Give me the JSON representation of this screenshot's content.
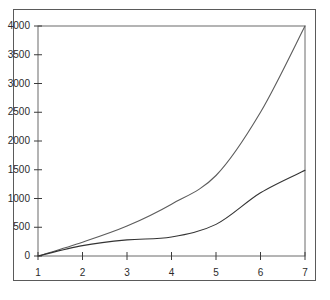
{
  "chart_data": {
    "type": "line",
    "title": "",
    "subtitle": "",
    "xlabel": "",
    "ylabel": "",
    "x": [
      1,
      2,
      3,
      4,
      5,
      6,
      7
    ],
    "xticks": [
      "1",
      "2",
      "3",
      "4",
      "5",
      "6",
      "7"
    ],
    "yticks": [
      "0",
      "500",
      "1000",
      "1500",
      "2000",
      "2500",
      "3000",
      "3500",
      "4000"
    ],
    "ytick_values": [
      0,
      500,
      1000,
      1500,
      2000,
      2500,
      3000,
      3500,
      4000
    ],
    "xlim": [
      1,
      7
    ],
    "ylim": [
      0,
      4000
    ],
    "grid": false,
    "legend": null,
    "legend_position": "none",
    "frame": "box",
    "series": [
      {
        "name": "upper-curve",
        "color": "#5c5c5c",
        "values": [
          0,
          240,
          520,
          900,
          1400,
          2500,
          4000
        ]
      },
      {
        "name": "lower-curve",
        "color": "#333333",
        "values": [
          0,
          180,
          280,
          330,
          550,
          1100,
          1490
        ]
      }
    ],
    "annotations": []
  },
  "axes": {
    "y_tick_labels": [
      "4000",
      "3500",
      "3000",
      "2500",
      "2000",
      "1500",
      "1000",
      "500",
      "0"
    ],
    "x_tick_labels": [
      "1",
      "2",
      "3",
      "4",
      "5",
      "6",
      "7"
    ]
  },
  "colors": {
    "background": "#ffffff",
    "frame": "#5a5a5a",
    "axis": "#3a3a3a",
    "series_upper": "#5c5c5c",
    "series_lower": "#333333",
    "tick_text": "#2b2b2b"
  }
}
